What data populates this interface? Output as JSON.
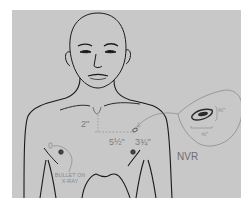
{
  "figure": {
    "background_color": "#c8c8c8",
    "line_color": "#1a1a1a",
    "annotation_color": "#7a7a7a"
  },
  "measurements": {
    "vertical_from_notch": "2\"",
    "horizontal_from_midline": "5½\"",
    "below_nipple_line": "3¾\"",
    "wound_length": "⅜\"",
    "wound_width": "⅝\""
  },
  "labels": {
    "inset": "NVR",
    "exit_note_line1": "BULLET ON",
    "exit_note_line2": "X-RAY"
  }
}
